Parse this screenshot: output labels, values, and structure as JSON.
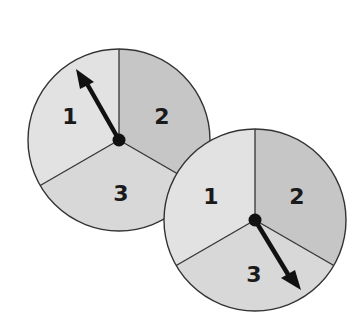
{
  "figure": {
    "colors": {
      "sector_light": "#e2e2e2",
      "sector_mid": "#d6d6d6",
      "sector_dark": "#c4c4c4",
      "outline": "#333333",
      "arrow": "#111111",
      "text": "#1a1a1a"
    },
    "spinners": [
      {
        "name": "spinner-1",
        "center": [
          119,
          140
        ],
        "radius": 91,
        "sectors": [
          {
            "label": "1",
            "position": "upper-left"
          },
          {
            "label": "2",
            "position": "upper-right"
          },
          {
            "label": "3",
            "position": "bottom"
          }
        ],
        "arrow_points_to": "1"
      },
      {
        "name": "spinner-2",
        "center": [
          255,
          220
        ],
        "radius": 91,
        "sectors": [
          {
            "label": "1",
            "position": "upper-left"
          },
          {
            "label": "2",
            "position": "upper-right"
          },
          {
            "label": "3",
            "position": "bottom"
          }
        ],
        "arrow_points_to": "3"
      }
    ]
  },
  "labels": {
    "s1": {
      "one": "1",
      "two": "2",
      "three": "3"
    },
    "s2": {
      "one": "1",
      "two": "2",
      "three": "3"
    }
  }
}
